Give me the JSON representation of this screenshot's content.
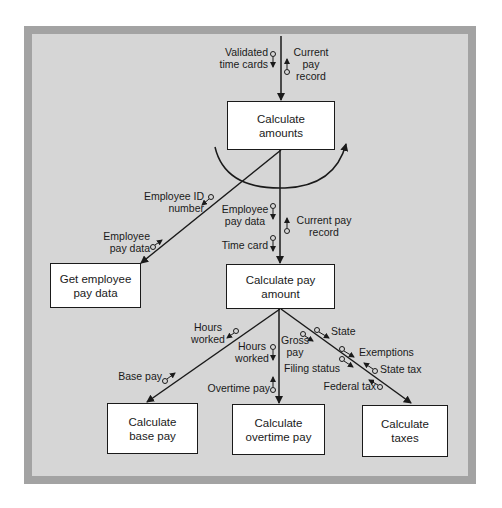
{
  "modules": {
    "calculate_amounts": [
      "Calculate",
      "amounts"
    ],
    "get_employee_pay_data": [
      "Get employee",
      "pay data"
    ],
    "calculate_pay_amount": [
      "Calculate pay",
      "amount"
    ],
    "calculate_base_pay": [
      "Calculate",
      "base pay"
    ],
    "calculate_overtime_pay": [
      "Calculate",
      "overtime pay"
    ],
    "calculate_taxes": [
      "Calculate",
      "taxes"
    ]
  },
  "couples": {
    "validated_time_cards": [
      "Validated",
      "time cards"
    ],
    "current_pay_record_top": [
      "Current",
      "pay",
      "record"
    ],
    "employee_id_number": [
      "Employee ID",
      "number"
    ],
    "employee_pay_data_left": [
      "Employee",
      "pay data"
    ],
    "employee_pay_data_mid": [
      "Employee",
      "pay data"
    ],
    "current_pay_record_mid": [
      "Current pay",
      "record"
    ],
    "time_card": "Time card",
    "hours_worked_left": [
      "Hours",
      "worked"
    ],
    "base_pay": "Base pay",
    "hours_worked_mid": [
      "Hours",
      "worked"
    ],
    "overtime_pay": "Overtime pay",
    "gross_pay": [
      "Gross",
      "pay"
    ],
    "state": "State",
    "exemptions": "Exemptions",
    "filing_status": "Filing status",
    "state_tax": "State tax",
    "federal_tax": "Federal tax"
  },
  "notation": {
    "loop_icon": "loop-arc-arrow",
    "data_couple_icon": "open-circle-arrow"
  },
  "colors": {
    "frame_border": "#a3a3a3",
    "frame_fill": "#d6d6d6",
    "module_fill": "#ffffff",
    "line": "#1a1a1a"
  }
}
